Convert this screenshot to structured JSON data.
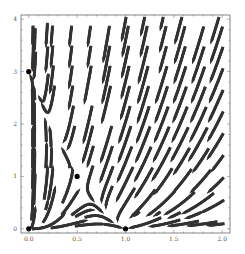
{
  "chart_data": {
    "type": "streamplot",
    "title": "",
    "xlabel": "",
    "ylabel": "",
    "xlim": [
      -0.08,
      2.08
    ],
    "ylim": [
      -0.08,
      4.08
    ],
    "x_ticks": [
      0.0,
      0.5,
      1.0,
      1.5,
      2.0
    ],
    "x_tick_labels": [
      "0.0",
      "0.5",
      "1.0",
      "1.5",
      "2.0"
    ],
    "y_ticks": [
      0,
      1,
      2,
      3,
      4
    ],
    "y_tick_labels": [
      "0",
      "1",
      "2",
      "3",
      "4"
    ],
    "grid": false,
    "vector_field": {
      "description": "Competitive Lotka-Volterra system",
      "dx": "x*(1 - x - 0.5*y)",
      "dy": "y*(3 - 4*x - y)"
    },
    "fixed_points": [
      {
        "x": 0,
        "y": 0,
        "label": "origin"
      },
      {
        "x": 1,
        "y": 0,
        "label": "x-axis equilibrium"
      },
      {
        "x": 0,
        "y": 3,
        "label": "y-axis equilibrium"
      },
      {
        "x": 0.5,
        "y": 1,
        "label": "coexistence saddle"
      }
    ],
    "colors": {
      "stream": "#555555",
      "arrow": "#333333",
      "fixed_point": "#000000",
      "frame": "#666666"
    }
  }
}
